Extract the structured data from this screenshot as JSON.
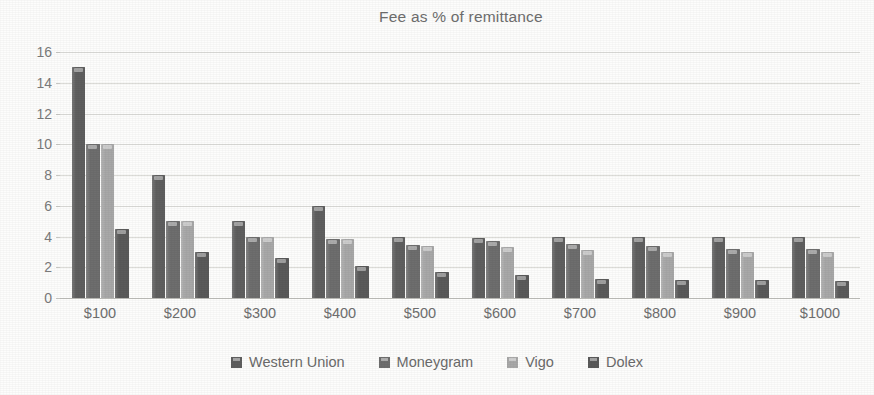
{
  "chart_data": {
    "type": "bar",
    "title": "Fee as % of remittance",
    "xlabel": "",
    "ylabel": "",
    "ylim": [
      0,
      16
    ],
    "ytick_step": 2,
    "yticks": [
      0,
      2,
      4,
      6,
      8,
      10,
      12,
      14,
      16
    ],
    "grid": true,
    "legend_position": "bottom",
    "categories": [
      "$100",
      "$200",
      "$300",
      "$400",
      "$500",
      "$600",
      "$700",
      "$800",
      "$900",
      "$1000"
    ],
    "series": [
      {
        "name": "Western Union",
        "color": "#5f5f5f",
        "values": [
          15,
          8,
          5,
          6,
          4,
          3.9,
          4,
          4,
          4,
          4
        ]
      },
      {
        "name": "Moneygram",
        "color": "#6e6e6e",
        "values": [
          10,
          5,
          4,
          3.85,
          3.45,
          3.7,
          3.5,
          3.4,
          3.2,
          3.2
        ]
      },
      {
        "name": "Vigo",
        "color": "#a8a8a8",
        "values": [
          10,
          5,
          4,
          3.85,
          3.4,
          3.3,
          3.1,
          3.0,
          3.0,
          3.0
        ]
      },
      {
        "name": "Dolex",
        "color": "#5a5a5a",
        "values": [
          4.5,
          3,
          2.6,
          2.1,
          1.7,
          1.5,
          1.25,
          1.15,
          1.2,
          1.1
        ]
      }
    ]
  },
  "axis": {
    "y_tick_labels": [
      "16",
      "14",
      "12",
      "10",
      "8",
      "6",
      "4",
      "2",
      "0"
    ],
    "x_tick_labels": [
      "$100",
      "$200",
      "$300",
      "$400",
      "$500",
      "$600",
      "$700",
      "$800",
      "$900",
      "$1000"
    ]
  },
  "legend": {
    "items": [
      {
        "label": "Western Union",
        "color": "#5f5f5f"
      },
      {
        "label": "Moneygram",
        "color": "#6e6e6e"
      },
      {
        "label": "Vigo",
        "color": "#a8a8a8"
      },
      {
        "label": "Dolex",
        "color": "#5a5a5a"
      }
    ]
  },
  "colors": {
    "text": "#6e6e6e",
    "gridline": "#dcdcd8",
    "axis": "#bdbdb9",
    "background": "#fdfdfc"
  }
}
